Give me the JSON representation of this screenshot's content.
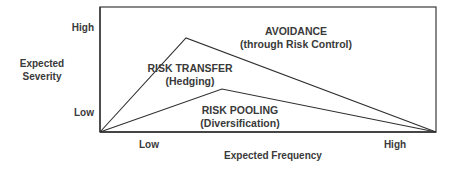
{
  "diagram": {
    "y_axis": {
      "title_line1": "Expected",
      "title_line2": "Severity",
      "high_label": "High",
      "low_label": "Low"
    },
    "x_axis": {
      "title": "Expected Frequency",
      "low_label": "Low",
      "high_label": "High"
    },
    "regions": [
      {
        "title": "AVOIDANCE",
        "subtitle": "(through Risk Control)"
      },
      {
        "title": "RISK TRANSFER",
        "subtitle": "(Hedging)"
      },
      {
        "title": "RISK POOLING",
        "subtitle": "(Diversification)"
      }
    ],
    "colors": {
      "line": "#2f2f2f",
      "text": "#3a3a3a",
      "background": "#ffffff"
    },
    "geometry": {
      "frame": {
        "x1": 100,
        "y1": 7,
        "x2": 436,
        "y2": 132
      },
      "transfer_peak": {
        "x": 186,
        "y": 38
      },
      "pooling_peak": {
        "x": 222,
        "y": 89
      }
    }
  }
}
